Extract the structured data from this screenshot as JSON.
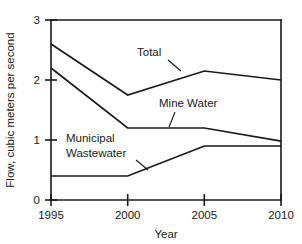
{
  "chart_data": {
    "type": "line",
    "title": "",
    "xlabel": "Year",
    "ylabel": "Flow, cubic meters per second",
    "x": [
      1995,
      2000,
      2005,
      2010
    ],
    "xticklabels": [
      "1995",
      "2000",
      "2005",
      "2010"
    ],
    "yticklabels": [
      "0",
      "1",
      "2",
      "3"
    ],
    "yticks": [
      0,
      1,
      2,
      3
    ],
    "xlim": [
      1995,
      2010
    ],
    "ylim": [
      0,
      3
    ],
    "grid": false,
    "legend_position": "inline-annotations",
    "series": [
      {
        "name": "Total",
        "values": [
          2.6,
          1.75,
          2.15,
          2.0
        ],
        "color": "#1a1a1a"
      },
      {
        "name": "Mine Water",
        "values": [
          2.2,
          1.2,
          1.2,
          0.98
        ],
        "color": "#1a1a1a"
      },
      {
        "name": "Municipal Wastewater",
        "values": [
          0.4,
          0.4,
          0.9,
          0.9
        ],
        "color": "#1a1a1a"
      }
    ],
    "annotations": [
      {
        "text": "Total",
        "series": "Total"
      },
      {
        "text": "Mine Water",
        "series": "Mine Water"
      },
      {
        "text": "Municipal",
        "series": "Municipal Wastewater"
      },
      {
        "text": "Wastewater",
        "series": "Municipal Wastewater"
      }
    ]
  }
}
